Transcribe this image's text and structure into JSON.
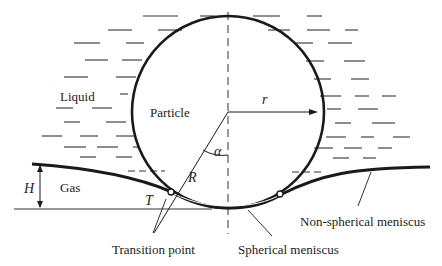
{
  "diagram": {
    "labels": {
      "liquid": "Liquid",
      "particle": "Particle",
      "gas": "Gas",
      "radius_small": "r",
      "radius_large": "R",
      "angle": "α",
      "height": "H",
      "tension": "T",
      "transition_point": "Transition point",
      "spherical_meniscus": "Spherical meniscus",
      "non_spherical_meniscus": "Non-spherical meniscus"
    },
    "colors": {
      "stroke": "#1a1a1a",
      "background": "#ffffff",
      "text": "#222222"
    }
  }
}
